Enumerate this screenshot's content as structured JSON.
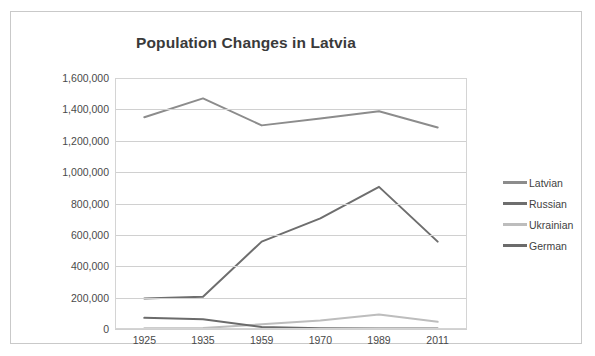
{
  "chart_data": {
    "type": "line",
    "title": "Population Changes in Latvia",
    "xlabel": "",
    "ylabel": "",
    "categories": [
      "1925",
      "1935",
      "1959",
      "1970",
      "1989",
      "2011"
    ],
    "ylim": [
      0,
      1600000
    ],
    "ytick_step": 200000,
    "yticks": [
      "0",
      "200,000",
      "400,000",
      "600,000",
      "800,000",
      "1,000,000",
      "1,200,000",
      "1,400,000",
      "1,600,000"
    ],
    "ytick_values": [
      0,
      200000,
      400000,
      600000,
      800000,
      1000000,
      1200000,
      1400000,
      1600000
    ],
    "grid": true,
    "legend_position": "right",
    "series": [
      {
        "name": "Latvian",
        "color": "#8c8c8c",
        "values": [
          1350000,
          1470000,
          1298000,
          1342000,
          1388000,
          1285000
        ]
      },
      {
        "name": "Russian",
        "color": "#6e6e6e",
        "values": [
          194000,
          206000,
          557000,
          705000,
          906000,
          557000
        ]
      },
      {
        "name": "Ukrainian",
        "color": "#bdbdbd",
        "values": [
          4000,
          6000,
          30000,
          54000,
          92000,
          46000
        ]
      },
      {
        "name": "German",
        "color": "#6b6b6b",
        "values": [
          71000,
          62000,
          13000,
          5000,
          3000,
          3000
        ]
      }
    ]
  },
  "legend": {
    "items": [
      {
        "label": "Latvian"
      },
      {
        "label": "Russian"
      },
      {
        "label": "Ukrainian"
      },
      {
        "label": "German"
      }
    ]
  }
}
